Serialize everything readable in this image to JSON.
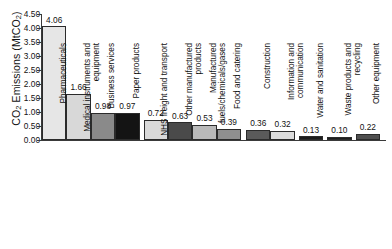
{
  "chart_data": {
    "type": "bar",
    "title": "",
    "xlabel": "",
    "ylabel": "CO2 Emissions (MtCO2)",
    "ylabel_rich": {
      "prefix": "CO",
      "sub1": "2",
      "mid": " Emissions (MtCO",
      "sub2": "2",
      "suffix": ")"
    },
    "ylim": [
      0,
      4.5
    ],
    "ytick_labels": [
      "0.00",
      "0.50",
      "1.00",
      "1.50",
      "2.00",
      "2.50",
      "3.00",
      "3.50",
      "4.00",
      "4.50"
    ],
    "ytick_values": [
      0,
      0.5,
      1,
      1.5,
      2,
      2.5,
      3,
      3.5,
      4,
      4.5
    ],
    "grid": false,
    "legend": "none",
    "categories": [
      "Pharmaceuticals",
      "Medical instruments and equipment",
      "Business services",
      "Paper products",
      "NHS freight and transport",
      "Other manufactured products",
      "Manufactured fuels/chemicals/gases",
      "Food and catering",
      "Construction",
      "Information and communication",
      "Water and sanitation",
      "Waste products and recycling",
      "Other equipment"
    ],
    "category_lines": [
      "Pharmaceuticals",
      "Medical instruments and\nequipment",
      "Business services",
      "Paper products",
      "NHS freight and transport",
      "Other manufactured\nproducts",
      "Manufactured\nfuels/chemicals/gases",
      "Food and catering",
      "Construction",
      "Information and\ncommunication",
      "Water and sanitation",
      "Waste products and\nrecycling",
      "Other equipment"
    ],
    "values": [
      4.06,
      1.66,
      0.98,
      0.97,
      0.72,
      0.63,
      0.53,
      0.39,
      0.36,
      0.32,
      0.13,
      0.1,
      0.22
    ],
    "value_labels": [
      "4.06",
      "1.66",
      "0.98",
      "0.97",
      "0.72",
      "0.63",
      "0.53",
      "0.39",
      "0.36",
      "0.32",
      "0.13",
      "0.10",
      "0.22"
    ],
    "bar_colors": [
      "#e6e6e6",
      "#d8d8d8",
      "#8a8a8a",
      "#141414",
      "#d9d9d9",
      "#4a4a4a",
      "#b9b9b9",
      "#8f8f8f",
      "#5a5a5a",
      "#dcdcdc",
      "#1c1c1c",
      "#1c1c1c",
      "#4f4f4f"
    ],
    "bar_edge_color": "#2b2b2b",
    "background_color": "#ffffff",
    "axis_color": "#3a3a3a",
    "text_color": "#111111"
  }
}
